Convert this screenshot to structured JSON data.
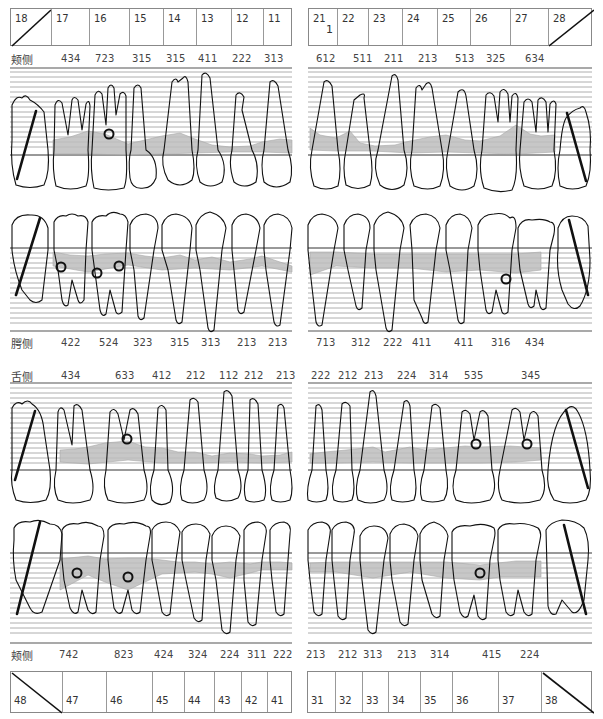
{
  "chart_title": "Periodontal chart",
  "colors": {
    "line": "#111111",
    "grid": "#9a9a9a",
    "pocket_fill": "#bdbdbd",
    "missing_slash": "#111111"
  },
  "upper": {
    "header": {
      "left_teeth": [
        "18",
        "17",
        "16",
        "15",
        "14",
        "13",
        "12",
        "11"
      ],
      "right_teeth": [
        "21",
        "22",
        "23",
        "24",
        "25",
        "26",
        "27",
        "28"
      ],
      "missing": [
        "18",
        "28"
      ],
      "tooth_21_mark": "1"
    },
    "buccal": {
      "label": "颊侧",
      "left_values": [
        "434",
        "723",
        "315",
        "315",
        "411",
        "222",
        "313"
      ],
      "right_values": [
        "612",
        "511",
        "211",
        "213",
        "513",
        "325",
        "634"
      ]
    },
    "palatal": {
      "label": "腭侧",
      "left_values": [
        "422",
        "524",
        "323",
        "315",
        "313",
        "213",
        "213"
      ],
      "right_values": [
        "713",
        "312",
        "222",
        "411",
        "411",
        "316",
        "434"
      ]
    }
  },
  "lower": {
    "lingual": {
      "label": "舌侧",
      "left_values": [
        "434",
        "633",
        "412",
        "212",
        "112",
        "212",
        "213"
      ],
      "right_values": [
        "222",
        "212",
        "213",
        "224",
        "314",
        "535",
        "345"
      ]
    },
    "buccal": {
      "label": "颊侧",
      "left_values": [
        "742",
        "823",
        "424",
        "324",
        "224",
        "311",
        "222"
      ],
      "right_values": [
        "213",
        "212",
        "313",
        "213",
        "314",
        "415",
        "224"
      ]
    },
    "header": {
      "left_teeth": [
        "48",
        "47",
        "46",
        "45",
        "44",
        "43",
        "42",
        "41"
      ],
      "right_teeth": [
        "31",
        "32",
        "33",
        "34",
        "35",
        "36",
        "37",
        "38"
      ],
      "missing": [
        "48",
        "38"
      ]
    }
  },
  "furcation_marks": {
    "upper_buccal": [
      "16"
    ],
    "upper_palatal": [
      "17",
      "16",
      "26"
    ],
    "lower_lingual": [
      "46",
      "36",
      "37"
    ],
    "lower_buccal": [
      "47",
      "46",
      "36"
    ]
  }
}
